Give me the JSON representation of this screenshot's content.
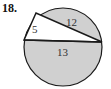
{
  "problem": {
    "number": "18."
  },
  "diagram": {
    "labels": {
      "short_leg": "5",
      "long_leg": "12",
      "hypotenuse": "13"
    },
    "colors": {
      "shade": "#d0d0d0",
      "stroke": "#1a1a1a",
      "triangle_fill": "#ffffff"
    }
  }
}
